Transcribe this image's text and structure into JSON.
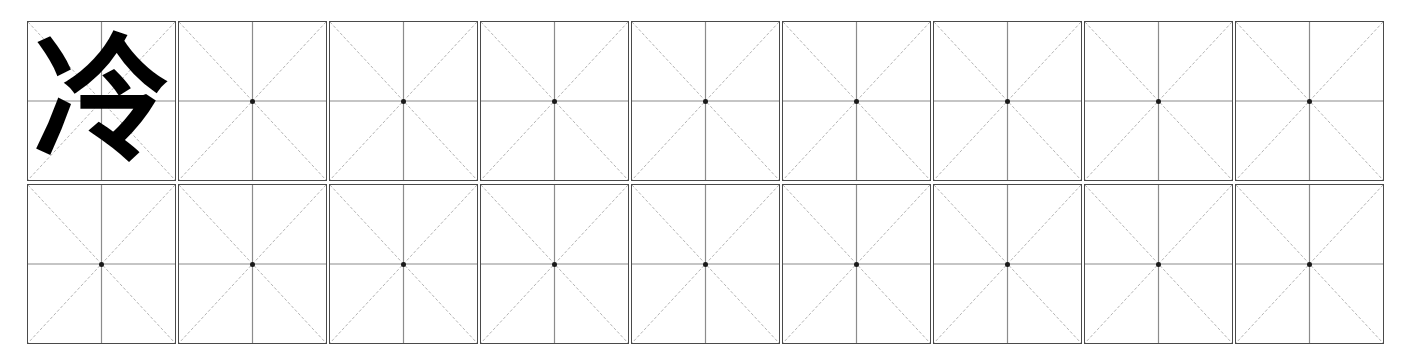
{
  "worksheet": {
    "title": "Chinese Character Practice Sheet",
    "character": "冷",
    "character_pinyin": "lěng",
    "grid_style": "mi-zi-ge",
    "rows": 2,
    "columns": 9,
    "colors": {
      "background": "#ffffff",
      "cell_border": "#4a4a4a",
      "center_line": "#8c8c8c",
      "diagonal_line": "#b4b4b4",
      "center_dot": "#1a1a1a",
      "glyph": "#000000"
    },
    "cells": [
      [
        {
          "id": "r1c1",
          "text": "冷",
          "filled": true
        },
        {
          "id": "r1c2",
          "text": "",
          "filled": false
        },
        {
          "id": "r1c3",
          "text": "",
          "filled": false
        },
        {
          "id": "r1c4",
          "text": "",
          "filled": false
        },
        {
          "id": "r1c5",
          "text": "",
          "filled": false
        },
        {
          "id": "r1c6",
          "text": "",
          "filled": false
        },
        {
          "id": "r1c7",
          "text": "",
          "filled": false
        },
        {
          "id": "r1c8",
          "text": "",
          "filled": false
        },
        {
          "id": "r1c9",
          "text": "",
          "filled": false
        }
      ],
      [
        {
          "id": "r2c1",
          "text": "",
          "filled": false
        },
        {
          "id": "r2c2",
          "text": "",
          "filled": false
        },
        {
          "id": "r2c3",
          "text": "",
          "filled": false
        },
        {
          "id": "r2c4",
          "text": "",
          "filled": false
        },
        {
          "id": "r2c5",
          "text": "",
          "filled": false
        },
        {
          "id": "r2c6",
          "text": "",
          "filled": false
        },
        {
          "id": "r2c7",
          "text": "",
          "filled": false
        },
        {
          "id": "r2c8",
          "text": "",
          "filled": false
        },
        {
          "id": "r2c9",
          "text": "",
          "filled": false
        }
      ]
    ]
  }
}
